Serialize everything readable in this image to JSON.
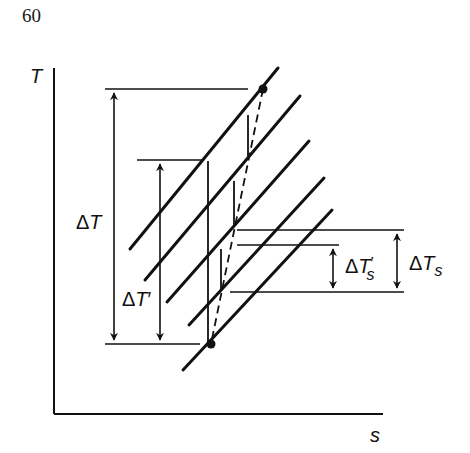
{
  "page_number": "60",
  "axes": {
    "y_label": "T",
    "x_label": "s"
  },
  "annotations": {
    "delta_T": {
      "delta": "Δ",
      "symbol": "T",
      "prime": ""
    },
    "delta_T_prime": {
      "delta": "Δ",
      "symbol": "T",
      "prime": "′"
    },
    "delta_Ts_prime": {
      "delta": "Δ",
      "symbol": "T",
      "prime": "′",
      "subscript": "s"
    },
    "delta_Ts": {
      "delta": "Δ",
      "symbol": "T",
      "subscript": "s"
    }
  },
  "colors": {
    "ink": "#111111",
    "background": "#ffffff"
  },
  "diagram": {
    "state_points": 2,
    "parallel_lines": 5
  }
}
